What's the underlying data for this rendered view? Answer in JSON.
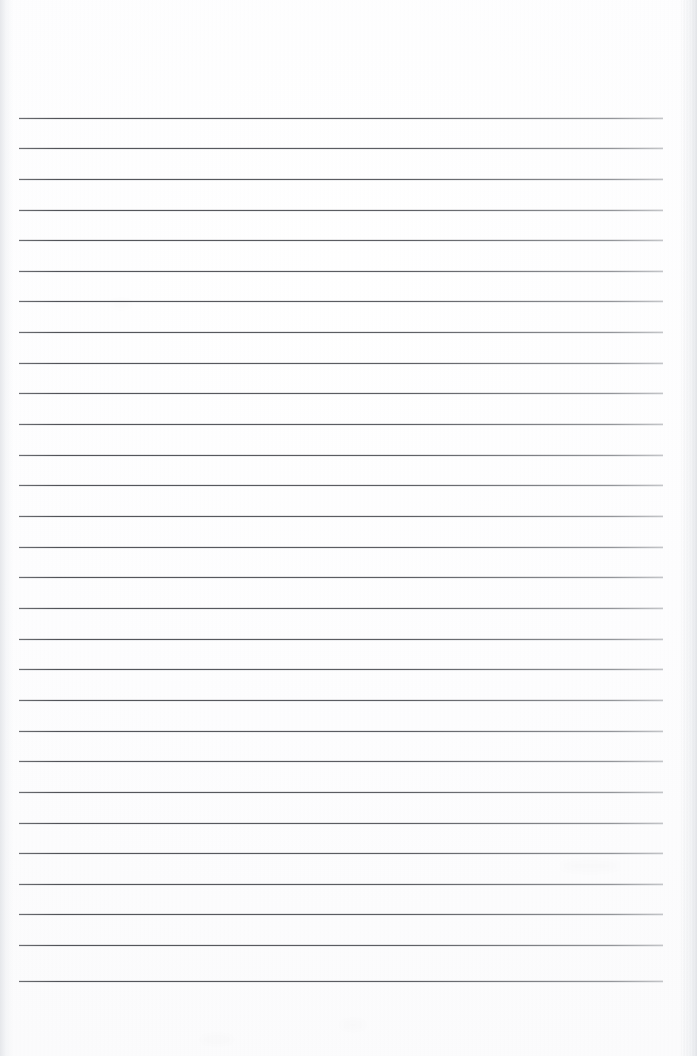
{
  "document": {
    "kind": "scanned-notebook-page",
    "title": "Blank Lined Notebook Page",
    "page_width": 697,
    "page_height": 1056,
    "background_color": "#fdfdfd",
    "has_text_content": false,
    "handwriting_present": false,
    "printed_text_present": false
  },
  "ruling": {
    "line_count": 29,
    "first_line_y": 117.5,
    "line_spacing": 30.65,
    "line_start_x": 19,
    "line_end_x": 663,
    "line_width": 644,
    "line_thickness": 1,
    "line_color": "#4e5055",
    "line_color_faded_right": "#9a9da2",
    "orientation": "horizontal",
    "margin_rule_present": false,
    "top_margin_blank_height": 117,
    "bottom_margin_blank_height": 75,
    "line_y_positions": [
      117.5,
      148.2,
      178.8,
      209.5,
      240.1,
      270.8,
      301.4,
      332.1,
      362.7,
      393.4,
      424.0,
      454.7,
      485.3,
      516.0,
      546.6,
      577.3,
      607.9,
      638.6,
      669.2,
      699.9,
      730.5,
      761.2,
      791.8,
      822.5,
      853.1,
      883.8,
      914.4,
      945.1,
      980.7
    ]
  },
  "scan_artifacts": {
    "left_edge_band_color": "#e2e4e8",
    "left_edge_band_width": 13,
    "right_edge_band_color": "#e5e7eb",
    "right_edge_band_width": 16,
    "texture": "fine vertical scanner banding",
    "smudges": [
      {
        "x": 340,
        "y": 1020,
        "w": 26,
        "h": 10
      },
      {
        "x": 200,
        "y": 1035,
        "w": 34,
        "h": 9
      },
      {
        "x": 560,
        "y": 860,
        "w": 60,
        "h": 12
      },
      {
        "x": 110,
        "y": 300,
        "w": 22,
        "h": 8
      }
    ]
  }
}
